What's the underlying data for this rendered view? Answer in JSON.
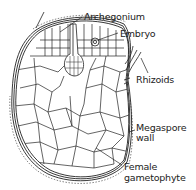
{
  "diagram": {
    "labels": {
      "archegonium": "Archegonium",
      "embryo": "Embryo",
      "rhizoids": "Rhizoids",
      "megaspore_wall_line1": "Megaspore",
      "megaspore_wall_line2": "wall",
      "female_gametophyte_line1": "Female",
      "female_gametophyte_line2": "gametophyte"
    },
    "colors": {
      "line": "#222222",
      "background": "#ffffff"
    }
  }
}
